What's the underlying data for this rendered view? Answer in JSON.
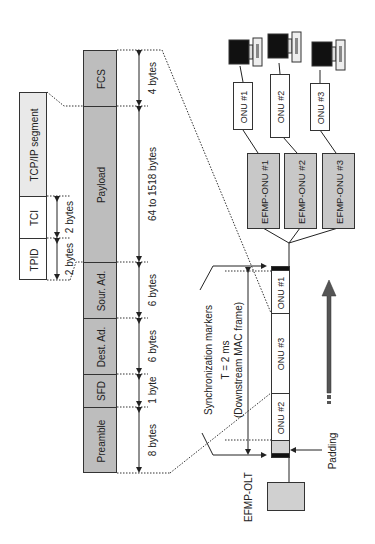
{
  "ethernet_frame": {
    "fields": [
      {
        "label": "FCS",
        "size": "4 bytes"
      },
      {
        "label": "Payload",
        "size": "64 to 1518 bytes"
      },
      {
        "label": "Sour. Ad.",
        "size": "6 bytes"
      },
      {
        "label": "Dest. Ad.",
        "size": "6 bytes"
      },
      {
        "label": "SFD",
        "size": "1 byte"
      },
      {
        "label": "Preamble",
        "size": "8 bytes"
      }
    ]
  },
  "vlan_tag": {
    "segment_label": "TCP/IP segment",
    "fields": [
      {
        "label": "TCI",
        "size": "2 bytes"
      },
      {
        "label": "TPID",
        "size": "2 bytes"
      }
    ]
  },
  "downstream": {
    "sync_markers_label": "Synchronization markers",
    "period_label": "T = 2 ms",
    "frame_label": "(Downstream MAC frame)",
    "padding_label": "Padding",
    "slots": [
      "ONU #1",
      "ONU #3",
      "ONU #2"
    ],
    "olt_label": "EFMP-OLT"
  },
  "onus": [
    {
      "efmp_label": "EFMP-ONU #1",
      "onu_label": "ONU #1"
    },
    {
      "efmp_label": "EFMP-ONU #2",
      "onu_label": "ONU #2"
    },
    {
      "efmp_label": "EFMP-ONU #3",
      "onu_label": "ONU #3"
    }
  ],
  "icons": {
    "computer": "computer-icon",
    "direction_arrow": "downstream-direction-arrow-icon"
  },
  "colors": {
    "field_gray": "#bdbdbd",
    "light_gray": "#e9e9e9",
    "marker_black": "#111111",
    "arrow_gray": "#555555"
  }
}
